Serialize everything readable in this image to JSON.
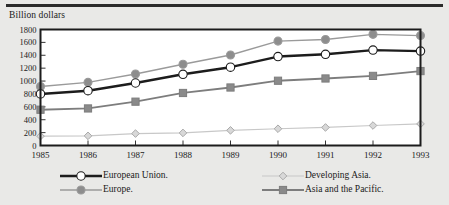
{
  "figure": {
    "axis_title": "Billion dollars",
    "top_rule": "horizontal-rule"
  },
  "chart_data": {
    "type": "line",
    "title": "",
    "subtitle": "",
    "xlabel": "",
    "ylabel": "Billion dollars",
    "x": [
      1985,
      1986,
      1987,
      1988,
      1989,
      1990,
      1991,
      1992,
      1993
    ],
    "categories": [
      "1985",
      "1986",
      "1987",
      "1988",
      "1989",
      "1990",
      "1991",
      "1992",
      "1993"
    ],
    "xlim": [
      1985,
      1993
    ],
    "ylim": [
      0,
      1800
    ],
    "yticks": [
      0,
      200,
      400,
      600,
      800,
      1000,
      1200,
      1400,
      1600,
      1800
    ],
    "ytick_labels": [
      "0",
      "200",
      "400",
      "600",
      "800",
      "1000",
      "1200",
      "1400",
      "1600",
      "1800"
    ],
    "grid": false,
    "legend_position": "bottom",
    "series": [
      {
        "name": "European Union.",
        "values": [
          800,
          850,
          970,
          1105,
          1215,
          1380,
          1415,
          1480,
          1465
        ],
        "color": "#1c1c1c",
        "marker": "circle",
        "marker_fill": "#ffffff",
        "line_width": 2.4,
        "marker_size": 4.2
      },
      {
        "name": "Europe.",
        "values": [
          915,
          980,
          1110,
          1260,
          1405,
          1620,
          1645,
          1725,
          1705
        ],
        "color": "#9a9a9a",
        "marker": "circle",
        "marker_fill": "#8d8d8d",
        "line_width": 1.4,
        "marker_size": 4.0
      },
      {
        "name": "Developing Asia.",
        "values": [
          145,
          150,
          185,
          195,
          235,
          260,
          280,
          310,
          335
        ],
        "color": "#c8c8c8",
        "marker": "diamond",
        "marker_fill": "#d8d8d8",
        "line_width": 1.2,
        "marker_size": 3.8
      },
      {
        "name": "Asia and the Pacific.",
        "values": [
          555,
          575,
          680,
          815,
          900,
          1005,
          1040,
          1080,
          1155
        ],
        "color": "#7d7d7d",
        "marker": "square",
        "marker_fill": "#8a8a8a",
        "line_width": 1.8,
        "marker_size": 3.6
      }
    ]
  },
  "legend": {
    "entries": [
      {
        "label": "European Union.",
        "series_index": 0
      },
      {
        "label": "Europe.",
        "series_index": 1
      },
      {
        "label": "Developing Asia.",
        "series_index": 2
      },
      {
        "label": "Asia and the Pacific.",
        "series_index": 3
      }
    ]
  },
  "colors": {
    "background": "#e9e9e7",
    "plot_background": "#ffffff",
    "frame": "#1c1c1c",
    "text": "#1a1a1a"
  }
}
